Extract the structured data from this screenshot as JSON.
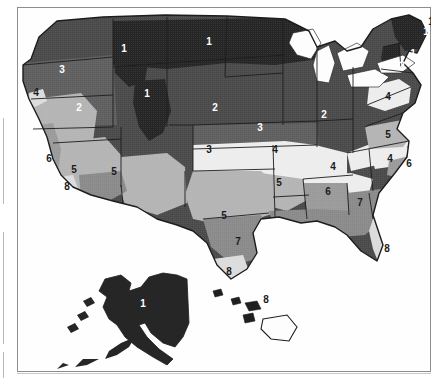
{
  "figure": {
    "type": "map",
    "frame_visible": true,
    "background_color": "#ffffff",
    "frame_color": "#8d8d8d",
    "style": "grayscale scanned halftone"
  },
  "legend_zones": [
    {
      "zone": "1",
      "color": "#262626"
    },
    {
      "zone": "2",
      "color": "#4a4a4a"
    },
    {
      "zone": "3",
      "color": "#5f5f5f"
    },
    {
      "zone": "4",
      "color": "#ededed"
    },
    {
      "zone": "5",
      "color": "#b4b4b4"
    },
    {
      "zone": "6",
      "color": "#9a9a9a"
    },
    {
      "zone": "7",
      "color": "#8a8a8a"
    },
    {
      "zone": "8",
      "color": "#dcdcdc"
    }
  ],
  "labels": [
    {
      "id": "pacific-northwest-3",
      "text": "3",
      "x": 45,
      "y": 66,
      "tone": "light"
    },
    {
      "id": "idaho-1",
      "text": "1",
      "x": 107,
      "y": 45,
      "tone": "light"
    },
    {
      "id": "montana-dakota-1",
      "text": "1",
      "x": 192,
      "y": 38,
      "tone": "light"
    },
    {
      "id": "minnesota-1",
      "text": "1",
      "x": 414,
      "y": 18,
      "tone": "dark"
    },
    {
      "id": "maine-1",
      "text": "1",
      "x": 409,
      "y": 28,
      "tone": "light"
    },
    {
      "id": "newengland-1",
      "text": "1",
      "x": 396,
      "y": 50,
      "tone": "light"
    },
    {
      "id": "wyoming-1",
      "text": "1",
      "x": 130,
      "y": 90,
      "tone": "light"
    },
    {
      "id": "newyork-2",
      "text": "2",
      "x": 385,
      "y": 62,
      "tone": "light"
    },
    {
      "id": "nevada-2",
      "text": "2",
      "x": 62,
      "y": 104,
      "tone": "light"
    },
    {
      "id": "nebraska-2",
      "text": "2",
      "x": 198,
      "y": 104,
      "tone": "light"
    },
    {
      "id": "illinois-2",
      "text": "2",
      "x": 307,
      "y": 111,
      "tone": "light"
    },
    {
      "id": "norcal-4",
      "text": "4",
      "x": 19,
      "y": 89,
      "tone": "dark"
    },
    {
      "id": "pennsylvania-4",
      "text": "4",
      "x": 371,
      "y": 93,
      "tone": "dark"
    },
    {
      "id": "kansas-3",
      "text": "3",
      "x": 243,
      "y": 124,
      "tone": "light"
    },
    {
      "id": "colorado-3",
      "text": "3",
      "x": 192,
      "y": 146,
      "tone": "dark"
    },
    {
      "id": "missouri-4",
      "text": "4",
      "x": 258,
      "y": 146,
      "tone": "dark"
    },
    {
      "id": "virginia-5",
      "text": "5",
      "x": 371,
      "y": 131,
      "tone": "dark"
    },
    {
      "id": "kentucky-4",
      "text": "4",
      "x": 316,
      "y": 163,
      "tone": "dark"
    },
    {
      "id": "northcarolina-4",
      "text": "4",
      "x": 373,
      "y": 155,
      "tone": "dark"
    },
    {
      "id": "carolina-6",
      "text": "6",
      "x": 392,
      "y": 160,
      "tone": "dark"
    },
    {
      "id": "california-6",
      "text": "6",
      "x": 32,
      "y": 155,
      "tone": "dark"
    },
    {
      "id": "arkansas-5",
      "text": "5",
      "x": 262,
      "y": 179,
      "tone": "dark"
    },
    {
      "id": "arizona-5",
      "text": "5",
      "x": 57,
      "y": 166,
      "tone": "dark"
    },
    {
      "id": "newmexico-5",
      "text": "5",
      "x": 97,
      "y": 168,
      "tone": "dark"
    },
    {
      "id": "socal-8",
      "text": "8",
      "x": 50,
      "y": 183,
      "tone": "dark"
    },
    {
      "id": "alabama-6",
      "text": "6",
      "x": 311,
      "y": 188,
      "tone": "dark"
    },
    {
      "id": "georgia-7",
      "text": "7",
      "x": 343,
      "y": 199,
      "tone": "dark"
    },
    {
      "id": "texas-5",
      "text": "5",
      "x": 207,
      "y": 212,
      "tone": "dark"
    },
    {
      "id": "southtexas-7",
      "text": "7",
      "x": 221,
      "y": 238,
      "tone": "dark"
    },
    {
      "id": "gulfcoast-8",
      "text": "8",
      "x": 212,
      "y": 268,
      "tone": "dark"
    },
    {
      "id": "florida-8",
      "text": "8",
      "x": 370,
      "y": 245,
      "tone": "dark"
    },
    {
      "id": "alaska-1",
      "text": "1",
      "x": 126,
      "y": 300,
      "tone": "light"
    },
    {
      "id": "hawaii-8",
      "text": "8",
      "x": 249,
      "y": 296,
      "tone": "dark"
    }
  ]
}
